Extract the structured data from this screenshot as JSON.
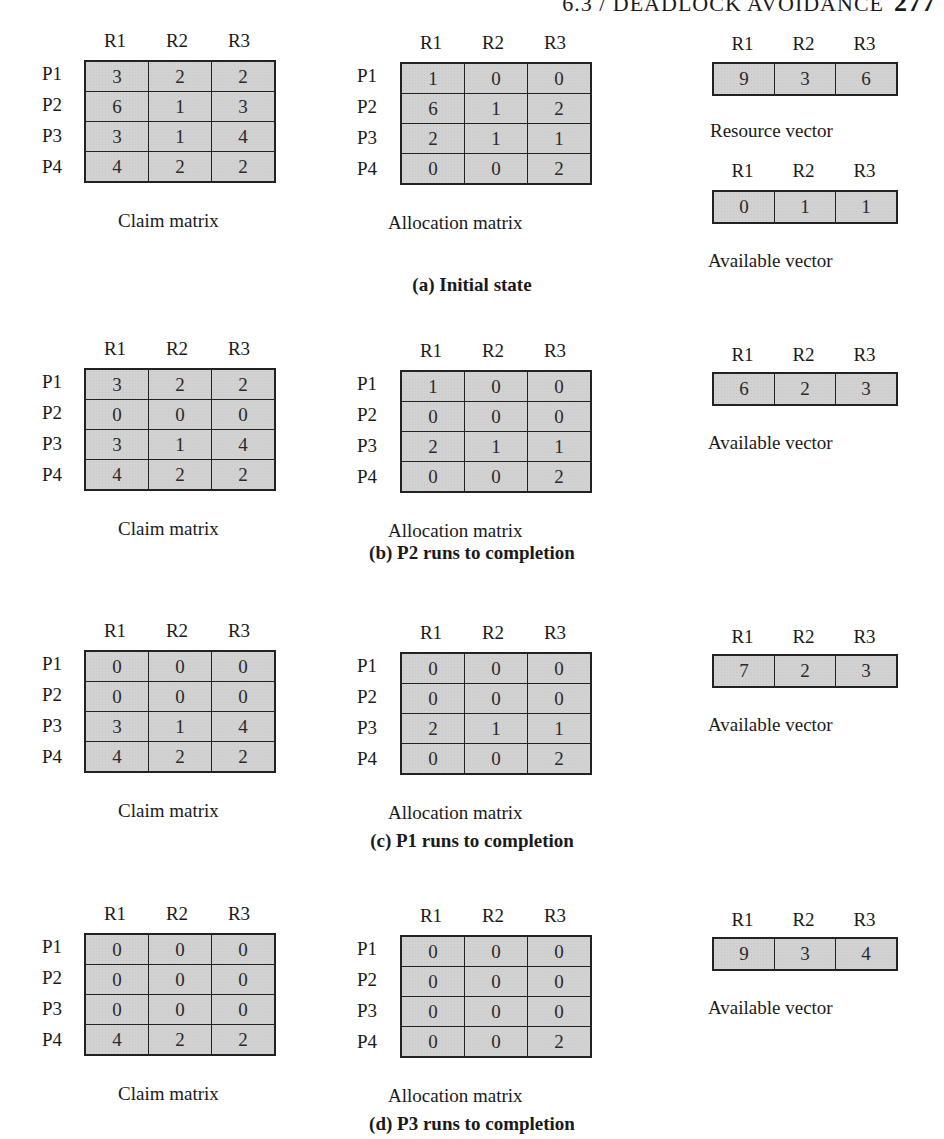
{
  "page_header": {
    "text": "6.3 / DEADLOCK AVOIDANCE",
    "page_number": "277"
  },
  "resources": [
    "R1",
    "R2",
    "R3"
  ],
  "processes": [
    "P1",
    "P2",
    "P3",
    "P4"
  ],
  "labels": {
    "claim": "Claim matrix",
    "allocation": "Allocation matrix",
    "resource_vector": "Resource vector",
    "available_vector": "Available vector"
  },
  "sections": [
    {
      "caption": "(a) Initial state",
      "claim": [
        [
          "3",
          "2",
          "2"
        ],
        [
          "6",
          "1",
          "3"
        ],
        [
          "3",
          "1",
          "4"
        ],
        [
          "4",
          "2",
          "2"
        ]
      ],
      "allocation": [
        [
          "1",
          "0",
          "0"
        ],
        [
          "6",
          "1",
          "2"
        ],
        [
          "2",
          "1",
          "1"
        ],
        [
          "0",
          "0",
          "2"
        ]
      ],
      "resource_vector": [
        "9",
        "3",
        "6"
      ],
      "available_vector": [
        "0",
        "1",
        "1"
      ]
    },
    {
      "caption": "(b) P2 runs to completion",
      "claim": [
        [
          "3",
          "2",
          "2"
        ],
        [
          "0",
          "0",
          "0"
        ],
        [
          "3",
          "1",
          "4"
        ],
        [
          "4",
          "2",
          "2"
        ]
      ],
      "allocation": [
        [
          "1",
          "0",
          "0"
        ],
        [
          "0",
          "0",
          "0"
        ],
        [
          "2",
          "1",
          "1"
        ],
        [
          "0",
          "0",
          "2"
        ]
      ],
      "available_vector": [
        "6",
        "2",
        "3"
      ]
    },
    {
      "caption": "(c) P1 runs to completion",
      "claim": [
        [
          "0",
          "0",
          "0"
        ],
        [
          "0",
          "0",
          "0"
        ],
        [
          "3",
          "1",
          "4"
        ],
        [
          "4",
          "2",
          "2"
        ]
      ],
      "allocation": [
        [
          "0",
          "0",
          "0"
        ],
        [
          "0",
          "0",
          "0"
        ],
        [
          "2",
          "1",
          "1"
        ],
        [
          "0",
          "0",
          "2"
        ]
      ],
      "available_vector": [
        "7",
        "2",
        "3"
      ]
    },
    {
      "caption": "(d) P3 runs to completion",
      "claim": [
        [
          "0",
          "0",
          "0"
        ],
        [
          "0",
          "0",
          "0"
        ],
        [
          "0",
          "0",
          "0"
        ],
        [
          "4",
          "2",
          "2"
        ]
      ],
      "allocation": [
        [
          "0",
          "0",
          "0"
        ],
        [
          "0",
          "0",
          "0"
        ],
        [
          "0",
          "0",
          "0"
        ],
        [
          "0",
          "0",
          "2"
        ]
      ],
      "available_vector": [
        "9",
        "3",
        "4"
      ]
    }
  ]
}
